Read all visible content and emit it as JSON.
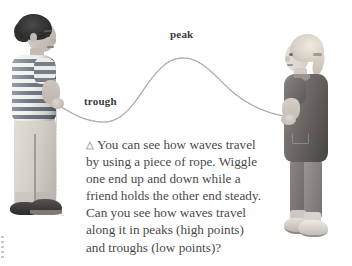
{
  "page": {
    "background_color": "#ffffff",
    "width": 352,
    "height": 266
  },
  "illustration": {
    "labels": {
      "peak": "peak",
      "trough": "trough"
    },
    "rope": {
      "color": "#9a9a9a",
      "description": "wave-shaped rope held between two children"
    },
    "figures": {
      "left_child": "boy-holding-rope",
      "right_child": "girl-holding-rope"
    }
  },
  "caption": {
    "marker": "△",
    "text": "You can see how waves travel by using a piece of rope. Wiggle one end up and down while a friend holds the other end steady. Can you see how waves travel along it in peaks (high points) and troughs (low points)?",
    "lines": [
      "You can see how waves travel",
      "by using a piece of rope. Wiggle",
      "one end up and down while a",
      "friend holds the other end steady.",
      "Can you see how waves travel",
      "along it in peaks (high points)",
      "and troughs (low points)?"
    ],
    "text_color": "#4a4a4a"
  }
}
